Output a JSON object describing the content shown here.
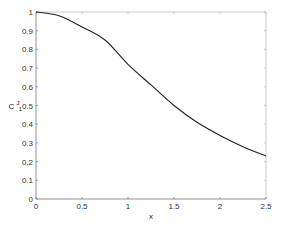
{
  "chart_data": {
    "type": "line",
    "title": "",
    "xlabel": "x",
    "ylabel": "C1J",
    "ylabel_parts": {
      "base": "C",
      "sub": "1",
      "sup": "J"
    },
    "xlim": [
      0,
      2.5
    ],
    "ylim": [
      0,
      1
    ],
    "xticks": [
      0,
      0.5,
      1,
      1.5,
      2,
      2.5
    ],
    "xtick_labels": [
      "0",
      "0.5",
      "1",
      "1.5",
      "2",
      "2.5"
    ],
    "yticks": [
      0,
      0.1,
      0.2,
      0.3,
      0.4,
      0.5,
      0.6,
      0.7,
      0.8,
      0.9,
      1
    ],
    "ytick_labels": [
      "0",
      "0.1",
      "0.2",
      "0.3",
      "0.4",
      "0.5",
      "0.6",
      "0.7",
      "0.8",
      "0.9",
      "1"
    ],
    "grid": false,
    "legend": null,
    "series": [
      {
        "name": "C1J",
        "color": "#222222",
        "x": [
          0,
          0.25,
          0.5,
          0.75,
          1.0,
          1.25,
          1.5,
          1.75,
          2.0,
          2.25,
          2.5
        ],
        "y": [
          1.0,
          0.98,
          0.92,
          0.85,
          0.72,
          0.61,
          0.5,
          0.41,
          0.34,
          0.28,
          0.23
        ]
      }
    ]
  },
  "layout": {
    "plot_left": 36,
    "plot_right": 266,
    "plot_top": 12,
    "plot_bottom": 199,
    "axis_color": "#777777",
    "frame_color": "#bbbbbb"
  }
}
